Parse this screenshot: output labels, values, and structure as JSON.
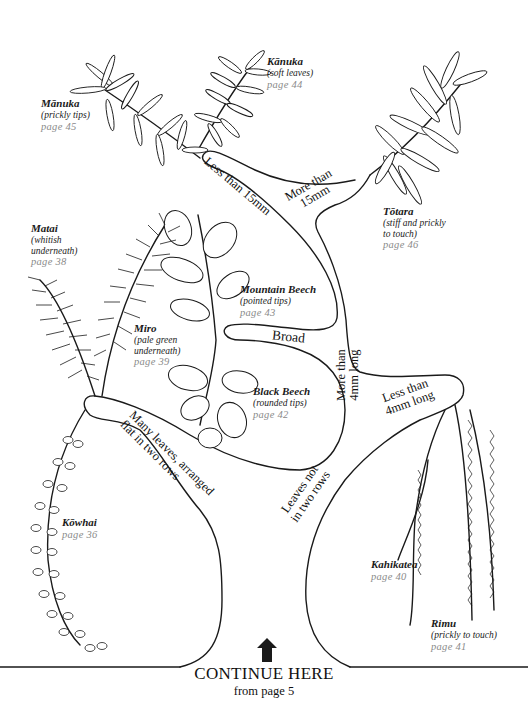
{
  "diagram": {
    "type": "identification-key-tree",
    "colors": {
      "line": "#1a1a1a",
      "page_ref": "#8a8a8a",
      "background": "#ffffff"
    }
  },
  "branches": {
    "less_than_15mm": "Less than 15mm",
    "more_than_15mm_line1": "More than",
    "more_than_15mm_line2": "15mm",
    "broad": "Broad",
    "more_than_4mm_line1": "More than",
    "more_than_4mm_line2": "4mm long",
    "less_than_4mm_line1": "Less than",
    "less_than_4mm_line2": "4mm long",
    "many_leaves_line1": "Many leaves, arranged",
    "many_leaves_line2": "flat in two rows",
    "leaves_not_line1": "Leaves not",
    "leaves_not_line2": "in two rows"
  },
  "species": [
    {
      "id": "manuka",
      "name": "Mānuka",
      "note": "(prickly tips)",
      "page": "page 45"
    },
    {
      "id": "kanuka",
      "name": "Kānuka",
      "note": "(soft leaves)",
      "page": "page 44"
    },
    {
      "id": "totara",
      "name": "Tōtara",
      "note": "(stiff and prickly to touch)",
      "note_line1": "(stiff and prickly",
      "note_line2": "to touch)",
      "page": "page 46"
    },
    {
      "id": "matai",
      "name": "Matai",
      "note_line1": "(whitish",
      "note_line2": "underneath)",
      "page": "page 38"
    },
    {
      "id": "mountain_beech",
      "name": "Mountain Beech",
      "note": "(pointed tips)",
      "page": "page 43"
    },
    {
      "id": "miro",
      "name": "Miro",
      "note_line1": "(pale green",
      "note_line2": "underneath)",
      "page": "page 39"
    },
    {
      "id": "black_beech",
      "name": "Black Beech",
      "note": "(rounded tips)",
      "page": "page 42"
    },
    {
      "id": "kowhai",
      "name": "Kōwhai",
      "page": "page 36"
    },
    {
      "id": "kahikatea",
      "name": "Kahikatea",
      "page": "page 40"
    },
    {
      "id": "rimu",
      "name": "Rimu",
      "note": "(prickly to touch)",
      "page": "page 41"
    }
  ],
  "footer": {
    "arrow_icon": "up-arrow-icon",
    "title": "CONTINUE HERE",
    "subtitle": "from page 5"
  }
}
